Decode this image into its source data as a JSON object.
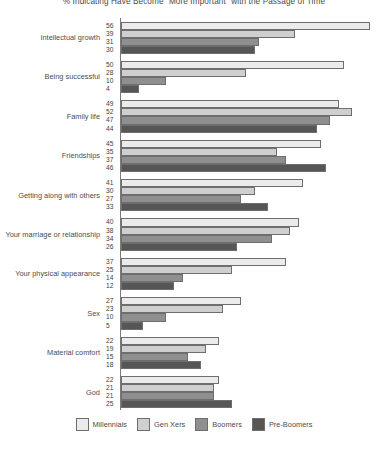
{
  "chart_data": {
    "type": "bar",
    "orientation": "horizontal",
    "title": "% Indicating Have Become \"More Important\" with the Passage of Time",
    "xlabel": "",
    "ylabel": "",
    "xlim": [
      0,
      60
    ],
    "grid": false,
    "legend_position": "bottom",
    "categories": [
      "Intellectual growth",
      "Being successful",
      "Family life",
      "Friendships",
      "Getting along with others",
      "Your marriage or relationship",
      "Your physical appearance",
      "Sex",
      "Material comfort",
      "God"
    ],
    "series": [
      {
        "name": "Millennials",
        "color": "#ebebeb",
        "values": [
          56,
          50,
          49,
          45,
          41,
          40,
          37,
          27,
          22,
          22
        ]
      },
      {
        "name": "Gen Xers",
        "color": "#cfcfcf",
        "values": [
          39,
          28,
          52,
          35,
          30,
          38,
          25,
          23,
          19,
          21
        ]
      },
      {
        "name": "Boomers",
        "color": "#8f8f8f",
        "values": [
          31,
          10,
          47,
          37,
          27,
          34,
          14,
          10,
          15,
          21
        ]
      },
      {
        "name": "Pre-Boomers",
        "color": "#565656",
        "values": [
          30,
          4,
          44,
          46,
          33,
          26,
          12,
          5,
          18,
          25
        ]
      }
    ]
  },
  "legend": {
    "items": [
      {
        "label": "Millennials",
        "color": "#ebebeb"
      },
      {
        "label": "Gen Xers",
        "color": "#cfcfcf"
      },
      {
        "label": "Boomers",
        "color": "#8f8f8f"
      },
      {
        "label": "Pre-Boomers",
        "color": "#565656"
      }
    ]
  }
}
